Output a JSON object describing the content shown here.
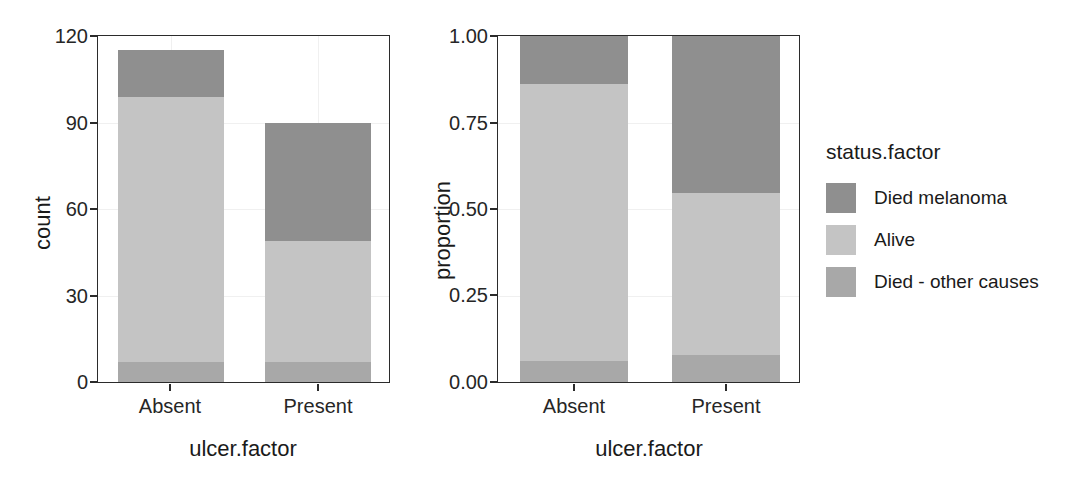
{
  "chart_data": {
    "type": "bar",
    "title": "",
    "subtitle": "",
    "stacked": true,
    "position": "stack",
    "grid": true,
    "legend": {
      "title": "status.factor",
      "position": "right",
      "entries": [
        {
          "label": "Died melanoma",
          "color": "#8f8f8f"
        },
        {
          "label": "Alive",
          "color": "#c4c4c4"
        },
        {
          "label": "Died - other causes",
          "color": "#a8a8a8"
        }
      ]
    },
    "panels": [
      {
        "id": "count-panel",
        "xlabel": "ulcer.factor",
        "ylabel": "count",
        "categories": [
          "Absent",
          "Present"
        ],
        "ylim": [
          0,
          120
        ],
        "yticks": [
          0,
          30,
          60,
          90,
          120
        ],
        "ytick_labels": [
          "0",
          "30",
          "60",
          "90",
          "120"
        ],
        "series": [
          {
            "name": "Died - other causes",
            "color": "#a8a8a8",
            "values": [
              7,
              7
            ]
          },
          {
            "name": "Alive",
            "color": "#c4c4c4",
            "values": [
              92,
              42
            ]
          },
          {
            "name": "Died melanoma",
            "color": "#8f8f8f",
            "values": [
              16,
              41
            ]
          }
        ],
        "totals": [
          115,
          90
        ]
      },
      {
        "id": "proportion-panel",
        "xlabel": "ulcer.factor",
        "ylabel": "proportion",
        "categories": [
          "Absent",
          "Present"
        ],
        "ylim": [
          0,
          1
        ],
        "yticks": [
          0,
          0.25,
          0.5,
          0.75,
          1
        ],
        "ytick_labels": [
          "0.00",
          "0.25",
          "0.50",
          "0.75",
          "1.00"
        ],
        "series": [
          {
            "name": "Died - other causes",
            "color": "#a8a8a8",
            "values": [
              0.061,
              0.078
            ]
          },
          {
            "name": "Alive",
            "color": "#c4c4c4",
            "values": [
              0.8,
              0.467
            ]
          },
          {
            "name": "Died melanoma",
            "color": "#8f8f8f",
            "values": [
              0.139,
              0.455
            ]
          }
        ],
        "totals": [
          1.0,
          1.0
        ]
      }
    ]
  }
}
